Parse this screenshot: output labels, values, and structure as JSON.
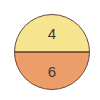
{
  "diagram": {
    "shape": "circle-split-horizontal",
    "top_section": {
      "value": "4",
      "fill": "#f7e48f"
    },
    "bottom_section": {
      "value": "6",
      "fill": "#eb9e6a"
    },
    "outline_color": "#6b4a3a",
    "divider_color": "#5a3a2a"
  }
}
